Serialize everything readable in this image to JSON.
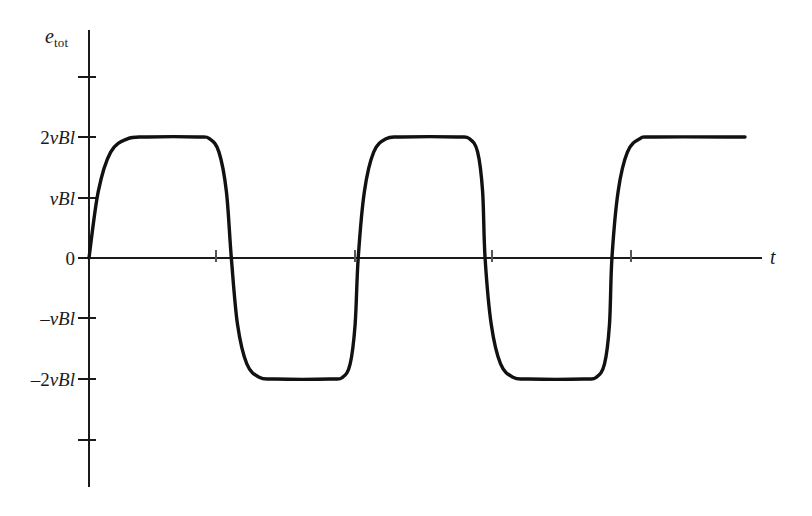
{
  "chart_data": {
    "type": "line",
    "title": "",
    "subtitle": "",
    "xlabel": "t",
    "ylabel": "e_tot",
    "ylabel_base": "e",
    "ylabel_sub": "tot",
    "grid": false,
    "legend": null,
    "xlim": [
      0,
      11.2
    ],
    "ylim": [
      -3.8,
      4.0
    ],
    "yticks": [
      {
        "value": 2,
        "label_prefix": "2",
        "label_italic": "vBl",
        "label": "2vBl",
        "labeled": true
      },
      {
        "value": 1,
        "label_prefix": "",
        "label_italic": "vBl",
        "label": "vBl",
        "labeled": true
      },
      {
        "value": 0,
        "label_prefix": "0",
        "label_italic": "",
        "label": "0",
        "labeled": true
      },
      {
        "value": -1,
        "label_prefix": "–",
        "label_italic": "vBl",
        "label": "–vBl",
        "labeled": true
      },
      {
        "value": -2,
        "label_prefix": "–2",
        "label_italic": "vBl",
        "label": "–2vBl",
        "labeled": true
      },
      {
        "value": 3,
        "label": "",
        "labeled": false
      },
      {
        "value": -3,
        "label": "",
        "labeled": false
      }
    ],
    "xticks_at_zero_crossings": [
      2.3,
      4.35,
      6.4,
      8.45
    ],
    "series": [
      {
        "name": "e_tot",
        "description": "Full-wave rectified-style square wave alternating between +2vBl and –2vBl with rounded rise and fall edges",
        "high_level": 2,
        "low_level": -2,
        "points": [
          {
            "x": 0.0,
            "y": 0.0
          },
          {
            "x": 0.15,
            "y": 1.1
          },
          {
            "x": 0.35,
            "y": 1.75
          },
          {
            "x": 0.62,
            "y": 1.97
          },
          {
            "x": 0.95,
            "y": 2.0
          },
          {
            "x": 1.75,
            "y": 2.0
          },
          {
            "x": 1.95,
            "y": 1.97
          },
          {
            "x": 2.1,
            "y": 1.75
          },
          {
            "x": 2.22,
            "y": 1.1
          },
          {
            "x": 2.3,
            "y": 0.0
          },
          {
            "x": 2.4,
            "y": -1.1
          },
          {
            "x": 2.55,
            "y": -1.75
          },
          {
            "x": 2.75,
            "y": -1.97
          },
          {
            "x": 3.0,
            "y": -2.0
          },
          {
            "x": 3.9,
            "y": -2.0
          },
          {
            "x": 4.1,
            "y": -1.97
          },
          {
            "x": 4.22,
            "y": -1.75
          },
          {
            "x": 4.3,
            "y": -1.1
          },
          {
            "x": 4.35,
            "y": 0.0
          },
          {
            "x": 4.45,
            "y": 1.1
          },
          {
            "x": 4.6,
            "y": 1.75
          },
          {
            "x": 4.8,
            "y": 1.97
          },
          {
            "x": 5.05,
            "y": 2.0
          },
          {
            "x": 5.95,
            "y": 2.0
          },
          {
            "x": 6.15,
            "y": 1.97
          },
          {
            "x": 6.28,
            "y": 1.75
          },
          {
            "x": 6.36,
            "y": 1.1
          },
          {
            "x": 6.4,
            "y": 0.0
          },
          {
            "x": 6.5,
            "y": -1.1
          },
          {
            "x": 6.65,
            "y": -1.75
          },
          {
            "x": 6.85,
            "y": -1.97
          },
          {
            "x": 7.1,
            "y": -2.0
          },
          {
            "x": 8.0,
            "y": -2.0
          },
          {
            "x": 8.2,
            "y": -1.97
          },
          {
            "x": 8.33,
            "y": -1.75
          },
          {
            "x": 8.41,
            "y": -1.1
          },
          {
            "x": 8.45,
            "y": 0.0
          },
          {
            "x": 8.55,
            "y": 1.1
          },
          {
            "x": 8.7,
            "y": 1.75
          },
          {
            "x": 8.9,
            "y": 1.97
          },
          {
            "x": 9.15,
            "y": 2.0
          },
          {
            "x": 10.6,
            "y": 2.0
          }
        ]
      }
    ]
  }
}
